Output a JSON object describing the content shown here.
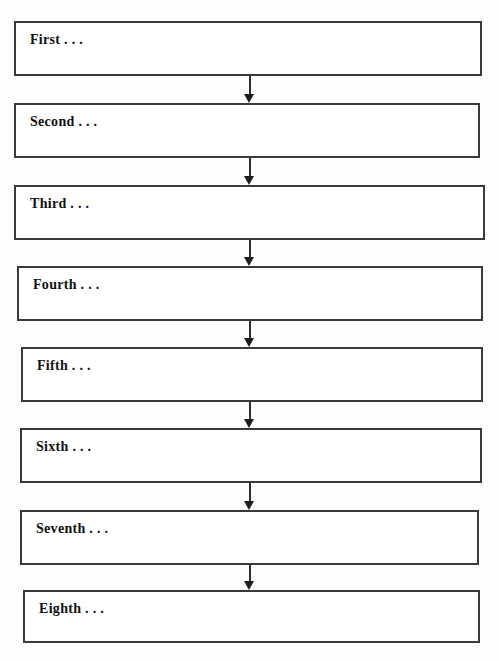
{
  "document": {
    "type": "flowchart",
    "orientation": "vertical-top-to-bottom",
    "clipped_header_text": "",
    "colors": {
      "box_border": "#3a3a3a",
      "box_fill": "#ffffff",
      "text": "#111111",
      "arrow": "#1d1d1d",
      "page_background": "#fdfdfd"
    }
  },
  "flow": {
    "connector_label": "down-arrow",
    "nodes": [
      {
        "label": "First . . .",
        "x": 14,
        "y": 21,
        "width": 468,
        "height": 55
      },
      {
        "label": "Second . . .",
        "x": 14,
        "y": 103,
        "width": 466,
        "height": 55
      },
      {
        "label": "Third . . .",
        "x": 14,
        "y": 185,
        "width": 471,
        "height": 55
      },
      {
        "label": "Fourth . . .",
        "x": 17,
        "y": 266,
        "width": 466,
        "height": 55
      },
      {
        "label": "Fifth . . .",
        "x": 21,
        "y": 347,
        "width": 462,
        "height": 55
      },
      {
        "label": "Sixth . . .",
        "x": 20,
        "y": 428,
        "width": 462,
        "height": 55
      },
      {
        "label": "Seventh . . .",
        "x": 20,
        "y": 510,
        "width": 459,
        "height": 55
      },
      {
        "label": "Eighth . . .",
        "x": 23,
        "y": 590,
        "width": 457,
        "height": 53
      }
    ],
    "connectors": [
      {
        "from": "First . . .",
        "to": "Second . . .",
        "x": 243,
        "y": 76,
        "length": 27
      },
      {
        "from": "Second . . .",
        "to": "Third . . .",
        "x": 243,
        "y": 158,
        "length": 27
      },
      {
        "from": "Third . . .",
        "to": "Fourth . . .",
        "x": 243,
        "y": 240,
        "length": 26
      },
      {
        "from": "Fourth . . .",
        "to": "Fifth . . .",
        "x": 243,
        "y": 321,
        "length": 26
      },
      {
        "from": "Fifth . . .",
        "to": "Sixth . . .",
        "x": 243,
        "y": 402,
        "length": 26
      },
      {
        "from": "Sixth . . .",
        "to": "Seventh . . .",
        "x": 243,
        "y": 483,
        "length": 27
      },
      {
        "from": "Seventh . . .",
        "to": "Eighth . . .",
        "x": 243,
        "y": 565,
        "length": 25
      }
    ]
  }
}
